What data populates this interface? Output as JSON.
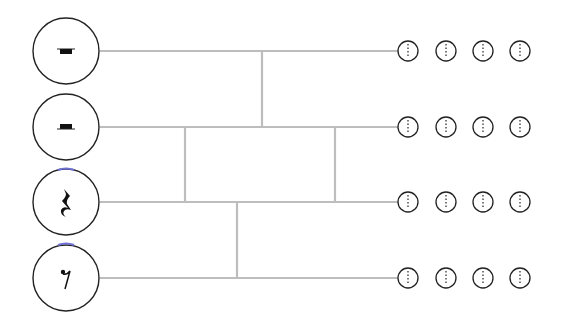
{
  "diagram": {
    "title": "",
    "type": "rhythm-subdivision-tree",
    "colors": {
      "line": "#bdbdbd",
      "stroke": "#222222",
      "glyph": "#111111",
      "accent": "#6f6fd8"
    },
    "rows": [
      {
        "id": "whole-rest",
        "glyph": "whole-rest",
        "label": "",
        "y": 51
      },
      {
        "id": "half-rest",
        "glyph": "half-rest",
        "label": "",
        "y": 127
      },
      {
        "id": "quarter-rest",
        "glyph": "quarter-rest",
        "label": "",
        "y": 202
      },
      {
        "id": "eighth-rest",
        "glyph": "eighth-rest",
        "label": "",
        "y": 278
      }
    ],
    "beat_circles_per_row": 4,
    "beat_circle_x": [
      408,
      446,
      483,
      520
    ]
  }
}
